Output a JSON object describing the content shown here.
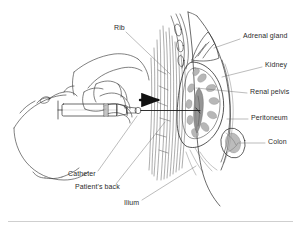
{
  "figure": {
    "ink_color": "#2b2b2b",
    "background_color": "#ffffff",
    "shade_color": "#9a9a9a"
  },
  "labels": [
    {
      "id": "rib",
      "text": "Rib",
      "x": 114,
      "y": 28,
      "align": "left"
    },
    {
      "id": "adrenal-gland",
      "text": "Adrenal gland",
      "x": 243,
      "y": 36,
      "align": "left"
    },
    {
      "id": "kidney",
      "text": "Kidney",
      "x": 265,
      "y": 65,
      "align": "left"
    },
    {
      "id": "renal-pelvis",
      "text": "Renal pelvis",
      "x": 250,
      "y": 92,
      "align": "left"
    },
    {
      "id": "peritoneum",
      "text": "Peritoneum",
      "x": 251,
      "y": 118,
      "align": "left"
    },
    {
      "id": "colon",
      "text": "Colon",
      "x": 268,
      "y": 142,
      "align": "left"
    },
    {
      "id": "catheter",
      "text": "Catheter",
      "x": 68,
      "y": 174,
      "align": "left"
    },
    {
      "id": "patients-back",
      "text": "Patient's back",
      "x": 75,
      "y": 187,
      "align": "left"
    },
    {
      "id": "ilium",
      "text": "Ilium",
      "x": 124,
      "y": 203,
      "align": "left"
    }
  ],
  "leader_lines": [
    {
      "id": "rib-leader",
      "from": [
        126,
        32
      ],
      "to": [
        170,
        74
      ]
    },
    {
      "id": "adrenal-gland-leader",
      "from": [
        240,
        39
      ],
      "to": [
        214,
        48
      ]
    },
    {
      "id": "kidney-leader",
      "from": [
        262,
        67
      ],
      "to": [
        222,
        77
      ]
    },
    {
      "id": "renal-pelvis-leader",
      "from": [
        247,
        93
      ],
      "to": [
        196,
        88
      ]
    },
    {
      "id": "peritoneum-leader",
      "from": [
        248,
        119
      ],
      "to": [
        227,
        119
      ]
    },
    {
      "id": "colon-leader",
      "from": [
        265,
        143
      ],
      "to": [
        239,
        143
      ]
    },
    {
      "id": "catheter-leader",
      "from": [
        98,
        171
      ],
      "to": [
        137,
        116
      ]
    },
    {
      "id": "patients-back-leader",
      "from": [
        116,
        184
      ],
      "to": [
        165,
        122
      ]
    },
    {
      "id": "ilium-leader",
      "from": [
        142,
        200
      ],
      "to": [
        196,
        166
      ]
    }
  ],
  "anatomy_parts": [
    {
      "id": "back-muscle-striations",
      "name": "Back muscle striations"
    },
    {
      "id": "kidney-outline",
      "name": "Kidney outline"
    },
    {
      "id": "renal-pyramids",
      "name": "Renal pyramids"
    },
    {
      "id": "renal-pelvis-shape",
      "name": "Renal pelvis"
    },
    {
      "id": "adrenal-gland-shape",
      "name": "Adrenal gland"
    },
    {
      "id": "peritoneum-line",
      "name": "Peritoneum membrane"
    },
    {
      "id": "colon-shape",
      "name": "Colon"
    },
    {
      "id": "rib-shapes",
      "name": "Ribs"
    },
    {
      "id": "body-outline",
      "name": "Body wall outline"
    }
  ],
  "instrument_parts": [
    {
      "id": "syringe-barrel",
      "name": "Syringe barrel"
    },
    {
      "id": "syringe-plunger",
      "name": "Syringe plunger"
    },
    {
      "id": "needle-shaft",
      "name": "Needle / catheter shaft"
    },
    {
      "id": "direction-arrow",
      "name": "Insertion direction arrow"
    },
    {
      "id": "operating-hand",
      "name": "Operating hand"
    },
    {
      "id": "support-hand",
      "name": "Supporting hand"
    }
  ]
}
